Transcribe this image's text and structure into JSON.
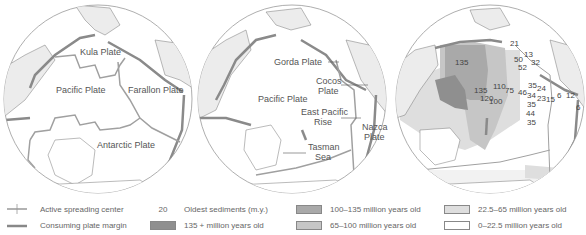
{
  "maps": {
    "map1": {
      "labels": [
        "Kula Plate",
        "Pacific Plate",
        "Farallon Plate",
        "Antarctic Plate"
      ]
    },
    "map2": {
      "labels": [
        "Gorda Plate",
        "Cocos Plate",
        "Pacific Plate",
        "East Pacific Rise",
        "Nazca Plate",
        "Tasman Sea"
      ],
      "cocos": [
        "Cocos",
        "Plate"
      ],
      "epr": [
        "East Pacific",
        "Rise"
      ],
      "nazca": [
        "Nazca",
        "Plate"
      ],
      "tasman": [
        "Tasman",
        "Sea"
      ]
    },
    "map3": {
      "sediment_ages": [
        "21",
        "13",
        "50",
        "52",
        "32",
        "135",
        "135",
        "110",
        "120",
        "100",
        "75",
        "46",
        "35",
        "24",
        "34",
        "23",
        "15",
        "35",
        "44",
        "35",
        "6",
        "12",
        "6"
      ]
    }
  },
  "legend": {
    "spreading": "Active spreading center",
    "consuming": "Consuming plate margin",
    "oldest_num": "20",
    "oldest": "Oldest sediments (m.y.)",
    "age1": "135 + million years old",
    "age2": "100–135 million years old",
    "age3": "65–100 million years old",
    "age4": "22.5–65 million years old",
    "age5": "0–22.5 million years old",
    "colors": {
      "age1": "#8f8f8f",
      "age2": "#a9a9a9",
      "age3": "#c6c6c6",
      "age4": "#dedede",
      "age5": "#ffffff"
    }
  }
}
